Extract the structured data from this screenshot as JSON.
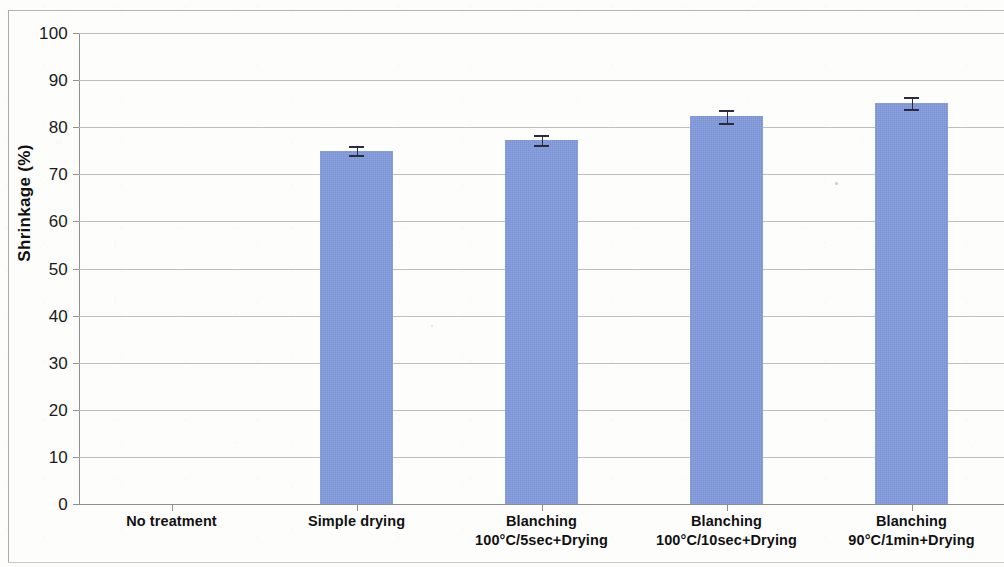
{
  "chart_data": {
    "type": "bar",
    "title": "",
    "xlabel": "",
    "ylabel": "Shrinkage (%)",
    "ylim": [
      0,
      100
    ],
    "ytick_step": 10,
    "yticks": [
      0,
      10,
      20,
      30,
      40,
      50,
      60,
      70,
      80,
      90,
      100
    ],
    "ytick_labels": [
      "0",
      "10",
      "20",
      "30",
      "40",
      "50",
      "60",
      "70",
      "80",
      "90",
      "100"
    ],
    "grid": true,
    "grid_axis": "y",
    "legend": false,
    "legend_position": "none",
    "bar_color": "#8099db",
    "error_bar_color": "#2b2b3d",
    "categories": [
      "No treatment",
      "Simple drying",
      "Blanching 100°C/5sec+Drying",
      "Blanching 100°C/10sec+Drying",
      "Blanching 90°C/1min+Drying"
    ],
    "category_lines": [
      [
        "No treatment",
        ""
      ],
      [
        "Simple drying",
        ""
      ],
      [
        "Blanching",
        "100°C/5sec+Drying"
      ],
      [
        "Blanching",
        "100°C/10sec+Drying"
      ],
      [
        "Blanching",
        "90°C/1min+Drying"
      ]
    ],
    "values": [
      0,
      75.0,
      77.3,
      82.3,
      85.2
    ],
    "errors": [
      0,
      1.0,
      1.0,
      1.4,
      1.3
    ],
    "series": [
      {
        "name": "Shrinkage",
        "values": [
          0,
          75.0,
          77.3,
          82.3,
          85.2
        ],
        "errors": [
          0,
          1.0,
          1.0,
          1.4,
          1.3
        ]
      }
    ]
  }
}
